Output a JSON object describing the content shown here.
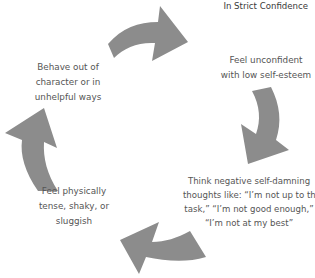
{
  "header": {
    "confidentiality": "In Strict Confidence"
  },
  "diagram": {
    "type": "cycle",
    "arrow_color": "#8c8c8c",
    "direction": "clockwise",
    "steps": [
      {
        "line1": "Feel unconfident",
        "line2": "with low self-esteem"
      },
      {
        "line1": "Think negative self-damning",
        "line2": "thoughts like: “I’m not up to the",
        "line3": "task,” “I’m not good enough,”",
        "line4": "“I’m not at my best”"
      },
      {
        "line1": "Feel physically",
        "line2": "tense, shaky, or",
        "line3": "sluggish"
      },
      {
        "line1": "Behave out of",
        "line2": "character or in",
        "line3": "unhelpful ways"
      }
    ],
    "arrows": [
      {
        "name": "top-arrow",
        "from": "Behave out of character or in unhelpful ways",
        "to": "Feel unconfident with low self-esteem"
      },
      {
        "name": "right-arrow",
        "from": "Feel unconfident with low self-esteem",
        "to": "Think negative self-damning thoughts"
      },
      {
        "name": "bottom-arrow",
        "from": "Think negative self-damning thoughts",
        "to": "Feel physically tense, shaky, or sluggish"
      },
      {
        "name": "left-arrow",
        "from": "Feel physically tense, shaky, or sluggish",
        "to": "Behave out of character or in unhelpful ways"
      }
    ]
  }
}
